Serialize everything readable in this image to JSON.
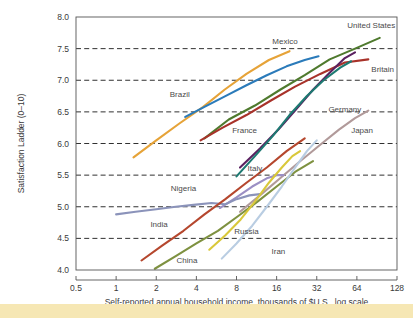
{
  "chart_data": {
    "type": "line",
    "title": "",
    "xlabel": "Self-reported annual household income, thousands of $U.S., log scale",
    "ylabel": "Satisfaction Ladder (0–10)",
    "xscale": "log",
    "xlim": [
      0.5,
      128
    ],
    "ylim": [
      4.0,
      8.0
    ],
    "grid": true,
    "legend_position": "inline-labels",
    "xticks": [
      "0.5",
      "1",
      "2",
      "4",
      "8",
      "16",
      "32",
      "64",
      "128"
    ],
    "xtick_values": [
      0.5,
      1,
      2,
      4,
      8,
      16,
      32,
      64,
      128
    ],
    "yticks": [
      "8.0",
      "7.5",
      "7.0",
      "6.5",
      "6.0",
      "5.5",
      "5.0",
      "4.5",
      "4.0"
    ],
    "ytick_values": [
      8.0,
      7.5,
      7.0,
      6.5,
      6.0,
      5.5,
      5.0,
      4.5,
      4.0
    ],
    "series": [
      {
        "name": "United States",
        "color": "#4f7a2e",
        "label_x": 82,
        "label_y": 7.88,
        "label_anchor": "middle",
        "points": [
          [
            4.6,
            6.08
          ],
          [
            7.0,
            6.38
          ],
          [
            11.0,
            6.6
          ],
          [
            17.0,
            6.85
          ],
          [
            26.0,
            7.08
          ],
          [
            40.0,
            7.33
          ],
          [
            62.0,
            7.5
          ],
          [
            95.0,
            7.67
          ]
        ]
      },
      {
        "name": "Britain",
        "color": "#a8322a",
        "label_x": 100,
        "label_y": 7.18,
        "label_anchor": "middle",
        "points": [
          [
            4.3,
            6.05
          ],
          [
            6.3,
            6.25
          ],
          [
            9.5,
            6.45
          ],
          [
            14.5,
            6.68
          ],
          [
            22.0,
            6.9
          ],
          [
            34.0,
            7.1
          ],
          [
            52.0,
            7.28
          ],
          [
            78.0,
            7.33
          ]
        ]
      },
      {
        "name": "Germany",
        "color": "#5a2160",
        "label_x": 52,
        "label_y": 6.55,
        "label_anchor": "middle",
        "points": [
          [
            8.5,
            5.62
          ],
          [
            12.0,
            5.92
          ],
          [
            16.5,
            6.22
          ],
          [
            22.0,
            6.52
          ],
          [
            30.0,
            6.85
          ],
          [
            40.0,
            7.12
          ],
          [
            52.0,
            7.35
          ],
          [
            62.0,
            7.44
          ]
        ]
      },
      {
        "name": "Japan",
        "color": "#b19a9a",
        "label_x": 70,
        "label_y": 6.22,
        "label_anchor": "middle",
        "points": [
          [
            8.5,
            4.92
          ],
          [
            12.0,
            5.18
          ],
          [
            17.0,
            5.45
          ],
          [
            24.0,
            5.72
          ],
          [
            34.0,
            5.98
          ],
          [
            47.0,
            6.22
          ],
          [
            62.0,
            6.4
          ],
          [
            78.0,
            6.52
          ]
        ]
      },
      {
        "name": "Mexico",
        "color": "#e6a338",
        "label_x": 18.5,
        "label_y": 7.62,
        "label_anchor": "middle",
        "points": [
          [
            1.35,
            5.78
          ],
          [
            2.0,
            6.05
          ],
          [
            3.0,
            6.32
          ],
          [
            4.5,
            6.58
          ],
          [
            6.5,
            6.85
          ],
          [
            9.5,
            7.1
          ],
          [
            14.0,
            7.32
          ],
          [
            20.0,
            7.46
          ]
        ]
      },
      {
        "name": "Brazil",
        "color": "#2b7bba",
        "label_x": 3.0,
        "label_y": 6.78,
        "label_anchor": "middle",
        "points": [
          [
            3.3,
            6.42
          ],
          [
            4.6,
            6.58
          ],
          [
            6.6,
            6.75
          ],
          [
            9.5,
            6.92
          ],
          [
            13.5,
            7.08
          ],
          [
            19.0,
            7.22
          ],
          [
            26.0,
            7.32
          ],
          [
            33.0,
            7.38
          ]
        ]
      },
      {
        "name": "France",
        "color": "#1d7a72",
        "label_x": 9.2,
        "label_y": 6.22,
        "label_anchor": "middle",
        "points": [
          [
            8.0,
            5.48
          ],
          [
            11.0,
            5.8
          ],
          [
            15.0,
            6.12
          ],
          [
            20.0,
            6.45
          ],
          [
            27.0,
            6.75
          ],
          [
            36.0,
            7.0
          ],
          [
            48.0,
            7.2
          ],
          [
            58.0,
            7.3
          ]
        ]
      },
      {
        "name": "Italy",
        "color": "#9b8fc4",
        "label_x": 11.0,
        "label_y": 5.62,
        "label_anchor": "middle",
        "points": [
          [
            6.0,
            4.98
          ],
          [
            8.0,
            5.15
          ],
          [
            10.5,
            5.32
          ],
          [
            13.5,
            5.45
          ],
          [
            16.0,
            5.5
          ],
          [
            18.0,
            5.5
          ]
        ]
      },
      {
        "name": "Nigeria",
        "color": "#8b93ba",
        "label_x": 3.2,
        "label_y": 5.3,
        "label_anchor": "middle",
        "points": [
          [
            1.0,
            4.88
          ],
          [
            1.4,
            4.92
          ],
          [
            2.0,
            4.96
          ],
          [
            2.8,
            5.0
          ],
          [
            3.8,
            5.03
          ],
          [
            5.2,
            5.06
          ],
          [
            6.6,
            5.04
          ],
          [
            8.0,
            5.12
          ],
          [
            10.0,
            5.18
          ],
          [
            12.0,
            5.2
          ]
        ]
      },
      {
        "name": "India",
        "color": "#b5472e",
        "label_x": 2.1,
        "label_y": 4.72,
        "label_anchor": "middle",
        "points": [
          [
            1.55,
            4.15
          ],
          [
            2.2,
            4.38
          ],
          [
            3.2,
            4.62
          ],
          [
            4.6,
            4.88
          ],
          [
            6.6,
            5.12
          ],
          [
            9.5,
            5.38
          ],
          [
            13.5,
            5.62
          ],
          [
            19.0,
            5.88
          ],
          [
            26.0,
            6.08
          ]
        ]
      },
      {
        "name": "China",
        "color": "#7e9140",
        "label_x": 3.4,
        "label_y": 4.16,
        "label_anchor": "middle",
        "points": [
          [
            1.95,
            4.02
          ],
          [
            2.8,
            4.22
          ],
          [
            4.0,
            4.42
          ],
          [
            5.8,
            4.62
          ],
          [
            8.2,
            4.85
          ],
          [
            11.5,
            5.08
          ],
          [
            16.0,
            5.32
          ],
          [
            22.0,
            5.55
          ],
          [
            30.0,
            5.72
          ]
        ]
      },
      {
        "name": "Russia",
        "color": "#d9c83a",
        "label_x": 9.5,
        "label_y": 4.62,
        "label_anchor": "middle",
        "points": [
          [
            5.0,
            4.32
          ],
          [
            6.6,
            4.55
          ],
          [
            8.6,
            4.8
          ],
          [
            11.0,
            5.08
          ],
          [
            14.0,
            5.38
          ],
          [
            17.5,
            5.62
          ],
          [
            21.0,
            5.8
          ],
          [
            24.0,
            5.88
          ]
        ]
      },
      {
        "name": "Iran",
        "color": "#b9cde2",
        "label_x": 16.5,
        "label_y": 4.3,
        "label_anchor": "middle",
        "points": [
          [
            6.2,
            4.18
          ],
          [
            8.0,
            4.42
          ],
          [
            10.5,
            4.7
          ],
          [
            13.5,
            5.0
          ],
          [
            17.5,
            5.32
          ],
          [
            22.0,
            5.62
          ],
          [
            27.0,
            5.88
          ],
          [
            32.0,
            6.05
          ]
        ]
      }
    ]
  }
}
